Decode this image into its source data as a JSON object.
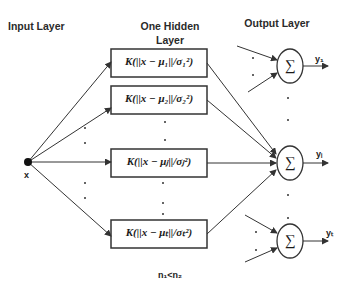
{
  "headers": {
    "input": "Input Layer",
    "hidden_line1": "One Hidden",
    "hidden_line2": "Layer",
    "output": "Output Layer"
  },
  "input_node": {
    "label": "x"
  },
  "hidden_nodes": [
    {
      "formula": "K(||x − μ₁||/σ₁²)"
    },
    {
      "formula": "K(||x − μ₂||/σ₂²)"
    },
    {
      "formula": "K(||x − μⱼ||/σⱼ²)"
    },
    {
      "formula": "K(||x − μₜ||/σₜ²)"
    }
  ],
  "output_nodes": [
    {
      "symbol": "∑",
      "label": "y₁"
    },
    {
      "symbol": "∑",
      "label": "yᵢ"
    },
    {
      "symbol": "∑",
      "label": "yₜ"
    }
  ],
  "footnote": "n₁<n₂",
  "colors": {
    "stroke": "#333333",
    "background": "#ffffff"
  }
}
